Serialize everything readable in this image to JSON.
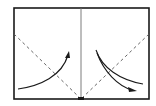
{
  "diagram": {
    "type": "origami-fold-diagram",
    "colors": {
      "background": "#ffffff",
      "line": "#1a1a1a",
      "dashed": "#555555",
      "center_line": "#6e6e6e"
    },
    "frame": {
      "x": 14,
      "y": 8,
      "width": 135,
      "height": 91
    },
    "center_crease": {
      "x": 81,
      "y1": 8,
      "y2": 99
    },
    "fold_lines": [
      {
        "name": "left-valley-fold",
        "style": "dashed",
        "from": [
          14,
          34
        ],
        "to": [
          81,
          99
        ]
      },
      {
        "name": "right-valley-fold",
        "style": "dashed",
        "from": [
          149,
          34
        ],
        "to": [
          81,
          99
        ]
      }
    ],
    "arrows": [
      {
        "name": "left-fold-arrow",
        "direction": "up-right"
      },
      {
        "name": "right-fold-arrow",
        "direction": "down-right"
      }
    ]
  }
}
